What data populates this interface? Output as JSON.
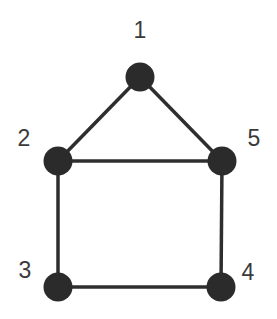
{
  "graph": {
    "nodes": [
      {
        "id": "1",
        "label": "1",
        "x": 140,
        "y": 77,
        "lx": 140,
        "ly": 38
      },
      {
        "id": "2",
        "label": "2",
        "x": 58,
        "y": 161,
        "lx": 24,
        "ly": 146
      },
      {
        "id": "3",
        "label": "3",
        "x": 58,
        "y": 287,
        "lx": 25,
        "ly": 278
      },
      {
        "id": "4",
        "label": "4",
        "x": 221,
        "y": 287,
        "lx": 248,
        "ly": 280
      },
      {
        "id": "5",
        "label": "5",
        "x": 222,
        "y": 161,
        "lx": 254,
        "ly": 146
      }
    ],
    "edges": [
      [
        "1",
        "2"
      ],
      [
        "1",
        "5"
      ],
      [
        "2",
        "5"
      ],
      [
        "2",
        "3"
      ],
      [
        "5",
        "4"
      ],
      [
        "3",
        "4"
      ]
    ],
    "node_color": "#2b2b2b",
    "edge_color": "#2e2e2e"
  }
}
